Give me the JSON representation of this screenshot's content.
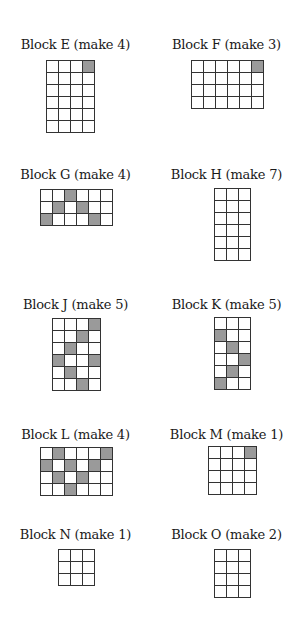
{
  "colors": {
    "shaded": "#9a9a9a",
    "empty": "#ffffff",
    "grid_line": "#333333"
  },
  "blocks": [
    {
      "id": "E",
      "title": "Block E (make 4)",
      "rows": 6,
      "cols": 4,
      "shaded": [
        [
          0,
          3
        ]
      ],
      "pos": {
        "x": 0,
        "y": 37
      },
      "grid": {
        "x": 46,
        "y": 60
      }
    },
    {
      "id": "F",
      "title": "Block F (make 3)",
      "rows": 4,
      "cols": 6,
      "shaded": [
        [
          0,
          5
        ]
      ],
      "pos": {
        "x": 151,
        "y": 37
      },
      "grid": {
        "x": 191,
        "y": 60
      }
    },
    {
      "id": "G",
      "title": "Block G (make 4)",
      "rows": 3,
      "cols": 6,
      "shaded": [
        [
          0,
          2
        ],
        [
          1,
          1
        ],
        [
          1,
          3
        ],
        [
          2,
          0
        ],
        [
          2,
          4
        ]
      ],
      "pos": {
        "x": 0,
        "y": 167
      },
      "grid": {
        "x": 40,
        "y": 189
      }
    },
    {
      "id": "H",
      "title": "Block H (make 7)",
      "rows": 6,
      "cols": 3,
      "shaded": [],
      "pos": {
        "x": 151,
        "y": 167
      },
      "grid": {
        "x": 214,
        "y": 188
      }
    },
    {
      "id": "J",
      "title": "Block J (make 5)",
      "rows": 6,
      "cols": 4,
      "shaded": [
        [
          0,
          3
        ],
        [
          1,
          2
        ],
        [
          2,
          1
        ],
        [
          3,
          0
        ],
        [
          3,
          3
        ],
        [
          4,
          1
        ],
        [
          5,
          2
        ]
      ],
      "pos": {
        "x": 0,
        "y": 297
      },
      "grid": {
        "x": 52,
        "y": 318
      }
    },
    {
      "id": "K",
      "title": "Block K (make 5)",
      "rows": 6,
      "cols": 3,
      "shaded": [
        [
          1,
          0
        ],
        [
          2,
          1
        ],
        [
          3,
          2
        ],
        [
          4,
          1
        ],
        [
          5,
          0
        ]
      ],
      "pos": {
        "x": 151,
        "y": 297
      },
      "grid": {
        "x": 214,
        "y": 317
      }
    },
    {
      "id": "L",
      "title": "Block L (make 4)",
      "rows": 4,
      "cols": 6,
      "shaded": [
        [
          0,
          1
        ],
        [
          0,
          5
        ],
        [
          1,
          0
        ],
        [
          1,
          2
        ],
        [
          1,
          4
        ],
        [
          2,
          1
        ],
        [
          2,
          3
        ],
        [
          3,
          2
        ]
      ],
      "pos": {
        "x": 0,
        "y": 427
      },
      "grid": {
        "x": 40,
        "y": 447
      }
    },
    {
      "id": "M",
      "title": "Block M (make 1)",
      "rows": 4,
      "cols": 4,
      "shaded": [
        [
          0,
          3
        ]
      ],
      "pos": {
        "x": 151,
        "y": 427
      },
      "grid": {
        "x": 208,
        "y": 446
      }
    },
    {
      "id": "N",
      "title": "Block N (make 1)",
      "rows": 3,
      "cols": 3,
      "shaded": [],
      "pos": {
        "x": 0,
        "y": 527
      },
      "grid": {
        "x": 58,
        "y": 549
      }
    },
    {
      "id": "O",
      "title": "Block O (make 2)",
      "rows": 4,
      "cols": 3,
      "shaded": [],
      "pos": {
        "x": 151,
        "y": 527
      },
      "grid": {
        "x": 214,
        "y": 549
      }
    }
  ]
}
